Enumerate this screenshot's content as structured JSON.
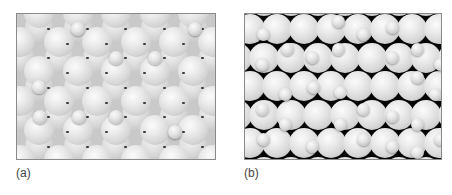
{
  "figure": {
    "panels": [
      {
        "id": "a",
        "label": "(a)",
        "background": "#c9c9c9",
        "large_sphere_diameter": 30,
        "small_sphere_diameter": 14,
        "small_spheres": [
          [
            61,
            15
          ],
          [
            178,
            15
          ],
          [
            99,
            44
          ],
          [
            138,
            44
          ],
          [
            22,
            73
          ],
          [
            23,
            103
          ],
          [
            62,
            103
          ],
          [
            99,
            103
          ],
          [
            158,
            118
          ]
        ]
      },
      {
        "id": "b",
        "label": "(b)",
        "background": "#050505",
        "large_sphere_diameter": 30,
        "small_sphere_diameter": 13,
        "small_spheres": [
          [
            18,
            20
          ],
          [
            42,
            35
          ],
          [
            67,
            43
          ],
          [
            93,
            7
          ],
          [
            93,
            35
          ],
          [
            118,
            20
          ],
          [
            147,
            13
          ],
          [
            147,
            43
          ],
          [
            172,
            35
          ],
          [
            17,
            50
          ],
          [
            40,
            80
          ],
          [
            68,
            73
          ],
          [
            95,
            78
          ],
          [
            118,
            95
          ],
          [
            147,
            102
          ],
          [
            172,
            63
          ],
          [
            195,
            50
          ],
          [
            190,
            80
          ],
          [
            17,
            95
          ],
          [
            40,
            110
          ],
          [
            67,
            132
          ],
          [
            95,
            110
          ],
          [
            118,
            125
          ],
          [
            147,
            132
          ],
          [
            172,
            110
          ],
          [
            18,
            125
          ],
          [
            195,
            125
          ],
          [
            172,
            138
          ]
        ]
      }
    ]
  }
}
